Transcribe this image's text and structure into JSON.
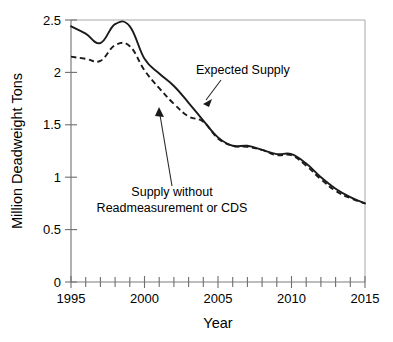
{
  "chart_data": {
    "type": "line",
    "title": "",
    "xlabel": "Year",
    "ylabel": "Million Deadweight Tons",
    "xlim": [
      1995,
      2015
    ],
    "ylim": [
      0,
      2.5
    ],
    "grid": false,
    "legend_position": "none",
    "x_tick_labels": [
      "1995",
      "2000",
      "2005",
      "2010",
      "2015"
    ],
    "x_tick_values": [
      1995,
      2000,
      2005,
      2010,
      2015
    ],
    "x_minor_tick_values": [
      1996,
      1997,
      1998,
      1999,
      2001,
      2002,
      2003,
      2004,
      2006,
      2007,
      2008,
      2009,
      2011,
      2012,
      2013,
      2014
    ],
    "y_tick_labels": [
      "0",
      "0.5",
      "1",
      "1.5",
      "2",
      "2.5"
    ],
    "y_tick_values": [
      0,
      0.5,
      1,
      1.5,
      2,
      2.5
    ],
    "x": [
      1995,
      1996,
      1997,
      1998,
      1999,
      2000,
      2001,
      2002,
      2003,
      2004,
      2005,
      2006,
      2007,
      2008,
      2009,
      2010,
      2011,
      2012,
      2013,
      2014,
      2015
    ],
    "series": [
      {
        "name": "Expected Supply",
        "style": "solid",
        "values": [
          2.44,
          2.37,
          2.28,
          2.46,
          2.44,
          2.13,
          1.99,
          1.87,
          1.71,
          1.54,
          1.38,
          1.3,
          1.3,
          1.26,
          1.22,
          1.22,
          1.13,
          1.0,
          0.89,
          0.81,
          0.75
        ]
      },
      {
        "name": "Supply without Readmeasurement or CDS",
        "style": "dashed",
        "values": [
          2.15,
          2.13,
          2.11,
          2.26,
          2.25,
          2.02,
          1.85,
          1.7,
          1.58,
          1.53,
          1.37,
          1.3,
          1.29,
          1.26,
          1.21,
          1.21,
          1.11,
          0.98,
          0.87,
          0.8,
          0.75
        ]
      }
    ],
    "annotations": [
      {
        "id": "expected-supply",
        "text": "Expected Supply",
        "text_lines": [
          "Expected Supply"
        ],
        "points_to_series": "Expected Supply",
        "points_to_x": 2002.6,
        "points_to_y": 1.79
      },
      {
        "id": "supply-without",
        "text": "Supply without Readmeasurement or CDS",
        "text_lines": [
          "Supply without",
          "Readmeasurement or CDS"
        ],
        "points_to_series": "Supply without Readmeasurement or CDS",
        "points_to_x": 2001.1,
        "points_to_y": 1.72
      }
    ]
  }
}
